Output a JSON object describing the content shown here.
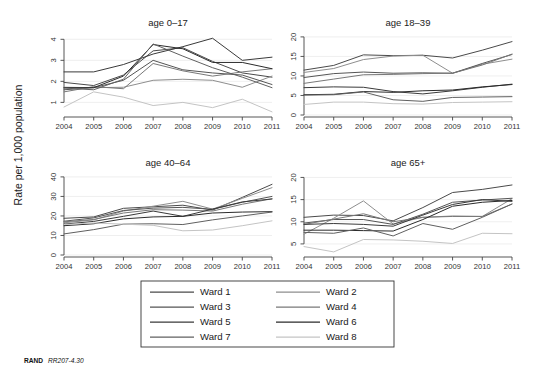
{
  "figure": {
    "ylabel": "Rate per 1,000 population",
    "footer_source": "RAND",
    "footer_id": "RR207-4.30"
  },
  "legend": {
    "items": [
      {
        "label": "Ward 1",
        "color": "#4a4a4a"
      },
      {
        "label": "Ward 2",
        "color": "#8e8e8e"
      },
      {
        "label": "Ward 3",
        "color": "#555555"
      },
      {
        "label": "Ward 4",
        "color": "#787878"
      },
      {
        "label": "Ward 5",
        "color": "#3a3a3a"
      },
      {
        "label": "Ward 6",
        "color": "#2b2b2b"
      },
      {
        "label": "Ward 7",
        "color": "#606060"
      },
      {
        "label": "Ward 8",
        "color": "#c4c4c4"
      }
    ]
  },
  "chart_data": {
    "type": "line",
    "title": "",
    "xlabel": "",
    "ylabel": "Rate per 1,000 population",
    "grid": true,
    "legend_position": "bottom",
    "x": [
      2004,
      2005,
      2006,
      2007,
      2008,
      2009,
      2010,
      2011
    ],
    "x_tick_labels": [
      "2004",
      "2005",
      "2006",
      "2007",
      "2008",
      "2009",
      "2010",
      "2011"
    ],
    "panels": [
      {
        "title": "age 0–17",
        "ylim": [
          0.4,
          4.3
        ],
        "y_ticks": [
          1,
          2,
          3,
          4
        ],
        "y_tick_labels": [
          "1",
          "2",
          "3",
          "4"
        ],
        "series": [
          {
            "name": "Ward 1",
            "color": "#4a4a4a",
            "values": [
              1.95,
              1.8,
              2.3,
              3.45,
              3.6,
              2.95,
              2.4,
              2.2
            ]
          },
          {
            "name": "Ward 2",
            "color": "#8e8e8e",
            "values": [
              1.72,
              1.7,
              1.72,
              2.05,
              2.1,
              2.05,
              1.72,
              2.25
            ]
          },
          {
            "name": "Ward 3",
            "color": "#555555",
            "values": [
              1.6,
              1.7,
              2.05,
              3.0,
              2.55,
              2.4,
              2.3,
              1.85
            ]
          },
          {
            "name": "Ward 4",
            "color": "#787878",
            "values": [
              1.5,
              1.75,
              1.65,
              2.85,
              2.5,
              2.25,
              2.45,
              2.6
            ]
          },
          {
            "name": "Ward 5",
            "color": "#3a3a3a",
            "values": [
              2.45,
              2.45,
              2.8,
              3.3,
              3.65,
              4.05,
              3.0,
              3.15
            ]
          },
          {
            "name": "Ward 6",
            "color": "#2b2b2b",
            "values": [
              1.7,
              1.7,
              2.25,
              3.75,
              3.55,
              2.9,
              2.9,
              2.6
            ]
          },
          {
            "name": "Ward 7",
            "color": "#606060",
            "values": [
              1.68,
              1.6,
              2.1,
              3.78,
              3.2,
              2.65,
              2.2,
              1.7
            ]
          },
          {
            "name": "Ward 8",
            "color": "#c4c4c4",
            "values": [
              0.78,
              1.5,
              1.25,
              0.85,
              1.0,
              0.75,
              1.15,
              0.55
            ]
          }
        ]
      },
      {
        "title": "age 18–39",
        "ylim": [
          0,
          21
        ],
        "y_ticks": [
          0,
          5,
          10,
          15,
          20
        ],
        "y_tick_labels": [
          "0",
          "5",
          "10",
          "15",
          "20"
        ],
        "series": [
          {
            "name": "Ward 1",
            "color": "#4a4a4a",
            "values": [
              11.5,
              12.7,
              15.4,
              15.2,
              15.3,
              14.6,
              16.6,
              18.8
            ]
          },
          {
            "name": "Ward 2",
            "color": "#8e8e8e",
            "values": [
              10.9,
              11.9,
              14.2,
              15.1,
              15.3,
              10.7,
              13.0,
              14.3
            ]
          },
          {
            "name": "Ward 3",
            "color": "#555555",
            "values": [
              9.6,
              10.6,
              11.0,
              10.7,
              10.8,
              10.7,
              13.2,
              15.5
            ]
          },
          {
            "name": "Ward 4",
            "color": "#787878",
            "values": [
              8.1,
              9.2,
              10.3,
              10.4,
              10.6,
              10.7,
              12.8,
              15.6
            ]
          },
          {
            "name": "Ward 5",
            "color": "#3a3a3a",
            "values": [
              7.0,
              7.2,
              7.1,
              6.0,
              5.4,
              6.2,
              7.1,
              7.9
            ]
          },
          {
            "name": "Ward 6",
            "color": "#2b2b2b",
            "values": [
              5.2,
              5.3,
              6.0,
              5.8,
              6.2,
              6.4,
              7.2,
              7.8
            ]
          },
          {
            "name": "Ward 7",
            "color": "#606060",
            "values": [
              5.1,
              5.2,
              5.9,
              3.9,
              3.5,
              4.5,
              4.6,
              4.7
            ]
          },
          {
            "name": "Ward 8",
            "color": "#c4c4c4",
            "values": [
              2.7,
              3.3,
              3.3,
              2.9,
              2.8,
              3.2,
              3.3,
              3.4
            ]
          }
        ]
      },
      {
        "title": "age 40–64",
        "ylim": [
          0,
          42
        ],
        "y_ticks": [
          0,
          10,
          20,
          30,
          40
        ],
        "y_tick_labels": [
          "0",
          "10",
          "20",
          "30",
          "40"
        ],
        "series": [
          {
            "name": "Ward 1",
            "color": "#4a4a4a",
            "values": [
              18.8,
              19.5,
              23.9,
              24.7,
              25.5,
              23.0,
              29.5,
              36.2
            ]
          },
          {
            "name": "Ward 2",
            "color": "#8e8e8e",
            "values": [
              16.5,
              18.0,
              22.5,
              25.0,
              27.5,
              23.5,
              29.0,
              34.5
            ]
          },
          {
            "name": "Ward 3",
            "color": "#555555",
            "values": [
              17.3,
              19.0,
              22.8,
              24.0,
              24.4,
              23.4,
              27.0,
              30.0
            ]
          },
          {
            "name": "Ward 4",
            "color": "#787878",
            "values": [
              17.0,
              18.2,
              21.5,
              23.2,
              23.0,
              22.5,
              26.0,
              28.8
            ]
          },
          {
            "name": "Ward 5",
            "color": "#3a3a3a",
            "values": [
              15.8,
              17.2,
              19.8,
              22.5,
              19.8,
              23.5,
              27.2,
              28.7
            ]
          },
          {
            "name": "Ward 6",
            "color": "#2b2b2b",
            "values": [
              15.0,
              16.0,
              18.5,
              19.5,
              19.8,
              21.5,
              22.0,
              22.2
            ]
          },
          {
            "name": "Ward 7",
            "color": "#606060",
            "values": [
              10.8,
              13.0,
              15.8,
              16.0,
              15.6,
              18.0,
              20.0,
              22.0
            ]
          },
          {
            "name": "Ward 8",
            "color": "#c4c4c4",
            "values": [
              15.6,
              16.4,
              15.8,
              15.2,
              12.4,
              12.8,
              15.0,
              17.5
            ]
          }
        ]
      },
      {
        "title": "age 65+",
        "ylim": [
          2.5,
          21
        ],
        "y_ticks": [
          5,
          10,
          15,
          20
        ],
        "y_tick_labels": [
          "5",
          "10",
          "15",
          "20"
        ],
        "series": [
          {
            "name": "Ward 1",
            "color": "#4a4a4a",
            "values": [
              11.0,
              11.5,
              11.4,
              10.2,
              13.2,
              16.6,
              17.3,
              18.3
            ]
          },
          {
            "name": "Ward 2",
            "color": "#8e8e8e",
            "values": [
              7.2,
              10.8,
              14.7,
              9.5,
              11.0,
              11.3,
              11.2,
              15.2
            ]
          },
          {
            "name": "Ward 3",
            "color": "#555555",
            "values": [
              9.7,
              10.5,
              10.5,
              9.4,
              11.7,
              14.4,
              14.9,
              15.3
            ]
          },
          {
            "name": "Ward 4",
            "color": "#787878",
            "values": [
              9.4,
              10.6,
              11.8,
              10.0,
              11.0,
              11.2,
              11.2,
              14.0
            ]
          },
          {
            "name": "Ward 5",
            "color": "#3a3a3a",
            "values": [
              9.4,
              9.6,
              9.4,
              9.0,
              11.5,
              13.9,
              15.0,
              14.6
            ]
          },
          {
            "name": "Ward 6",
            "color": "#2b2b2b",
            "values": [
              8.1,
              8.1,
              8.0,
              7.9,
              10.5,
              13.5,
              14.4,
              14.8
            ]
          },
          {
            "name": "Ward 7",
            "color": "#606060",
            "values": [
              7.6,
              7.4,
              8.6,
              6.8,
              9.6,
              8.3,
              11.0,
              14.0
            ]
          },
          {
            "name": "Ward 8",
            "color": "#c4c4c4",
            "values": [
              4.4,
              3.2,
              6.0,
              5.9,
              5.6,
              5.1,
              7.4,
              7.3
            ]
          }
        ]
      }
    ]
  }
}
